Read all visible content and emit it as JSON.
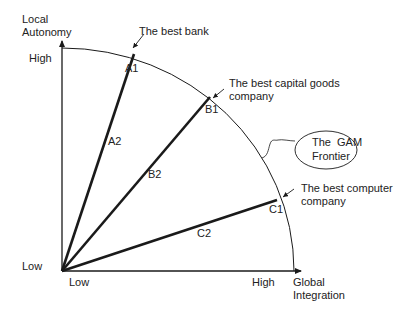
{
  "axes": {
    "y_label_line1": "Local",
    "y_label_line2": "Autonomy",
    "y_high": "High",
    "y_low": "Low",
    "x_low": "Low",
    "x_high": "High",
    "x_label_line1": "Global",
    "x_label_line2": "Integration"
  },
  "frontier": {
    "label_line1": "The  GAM",
    "label_line2": "Frontier"
  },
  "vectors": [
    {
      "end_label": "A1",
      "mid_label": "A2",
      "annotation": [
        "The best bank"
      ]
    },
    {
      "end_label": "B1",
      "mid_label": "B2",
      "annotation": [
        "The best capital goods",
        "company"
      ]
    },
    {
      "end_label": "C1",
      "mid_label": "C2",
      "annotation": [
        "The best computer",
        "company"
      ]
    }
  ],
  "colors": {
    "line": "#1a1a1a",
    "text": "#222222"
  }
}
